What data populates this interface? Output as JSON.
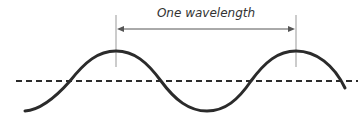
{
  "diagram": {
    "label": "One wavelength",
    "colors": {
      "wave": "#2b2b2b",
      "axis": "#2b2b2b",
      "marker": "#999999",
      "arrow": "#555555",
      "text": "#333333"
    },
    "wave": {
      "shape": "sine",
      "cycles_shown": 1.6,
      "midline_y": 81,
      "amplitude_px": 30,
      "wavelength_px": 180,
      "peaks_x": [
        116,
        296
      ],
      "trough_x": [
        207
      ]
    },
    "markers": [
      {
        "name": "first-crest-marker",
        "x": 116
      },
      {
        "name": "second-crest-marker",
        "x": 296
      }
    ],
    "arrow": {
      "from_x": 116,
      "to_x": 296,
      "y": 29,
      "double_headed": true
    }
  }
}
